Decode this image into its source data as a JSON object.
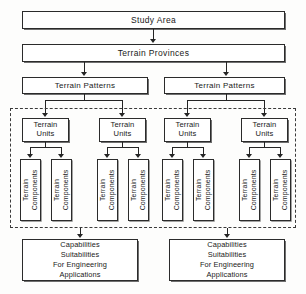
{
  "diagram": {
    "background_color": "#fdfdfc",
    "line_color": "#242424",
    "box_border_color": "#2b2b2b",
    "dashed_frame_color": "#3a3a3a"
  },
  "levels": {
    "study_area": {
      "label": "Study Area"
    },
    "terrain_provinces": {
      "label": "Terrain Provinces"
    },
    "terrain_patterns": [
      {
        "label": "Terrain Patterns"
      },
      {
        "label": "Terrain Patterns"
      }
    ],
    "terrain_units": [
      {
        "label": "Terrain\nUnits",
        "line1": "Terrain",
        "line2": "Units"
      },
      {
        "label": "Terrain\nUnits",
        "line1": "Terrain",
        "line2": "Units"
      },
      {
        "label": "Terrain\nUnits",
        "line1": "Terrain",
        "line2": "Units"
      },
      {
        "label": "Terrain\nUnits",
        "line1": "Terrain",
        "line2": "Units"
      }
    ],
    "terrain_components": [
      {
        "line1": "Terrain",
        "line2": "Components"
      },
      {
        "line1": "Terrain",
        "line2": "Components"
      },
      {
        "line1": "Terrain",
        "line2": "Components"
      },
      {
        "line1": "Terrain",
        "line2": "Components"
      },
      {
        "line1": "Terrain",
        "line2": "Components"
      },
      {
        "line1": "Terrain",
        "line2": "Components"
      },
      {
        "line1": "Terrain",
        "line2": "Components"
      },
      {
        "line1": "Terrain",
        "line2": "Components"
      }
    ],
    "capabilities": [
      {
        "line1": "Capabilities",
        "line2": "Suitabilities",
        "line3": "For Engineering",
        "line4": "Applications"
      },
      {
        "line1": "Capabilities",
        "line2": "Suitabilities",
        "line3": "For Engineering",
        "line4": "Applications"
      }
    ]
  }
}
